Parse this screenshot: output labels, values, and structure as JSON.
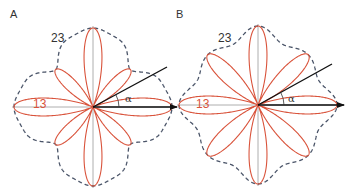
{
  "figure": {
    "panels": [
      {
        "id": "A",
        "label": "A",
        "label_pos": [
          10,
          18
        ],
        "center": [
          93,
          107
        ],
        "radius": 79,
        "diag_petal_ratio": 0.67,
        "envelope": {
          "axis": 1.0,
          "diag": 0.67,
          "bulge": 0.86
        },
        "alpha_line_end": [
          167,
          67
        ],
        "arrow_end": [
          177,
          107
        ],
        "alpha_label_pos": [
          125,
          102
        ],
        "curve_labels": [
          {
            "text": "23",
            "pos": [
              51,
              42
            ],
            "color": "#333333"
          },
          {
            "text": "13",
            "pos": [
              33,
              108
            ],
            "color": "#d9533b"
          }
        ],
        "alpha_symbol": "α"
      },
      {
        "id": "B",
        "label": "B",
        "label_pos": [
          176,
          18
        ],
        "center": [
          258,
          105
        ],
        "radius": 79,
        "diag_petal_ratio": 0.9,
        "envelope": {
          "axis": 1.0,
          "diag": 0.9,
          "bulge": 0.62
        },
        "alpha_line_end": [
          332,
          64
        ],
        "arrow_end": [
          344,
          105
        ],
        "alpha_label_pos": [
          288,
          102
        ],
        "curve_labels": [
          {
            "text": "23",
            "pos": [
              218,
              42
            ],
            "color": "#333333"
          },
          {
            "text": "13",
            "pos": [
              196,
              108
            ],
            "color": "#d9533b"
          }
        ],
        "alpha_symbol": "α"
      }
    ],
    "colors": {
      "petal": "#d9533b",
      "envelope": "#4a5468",
      "axis": "#9a9a9a",
      "vector": "#111111"
    }
  }
}
